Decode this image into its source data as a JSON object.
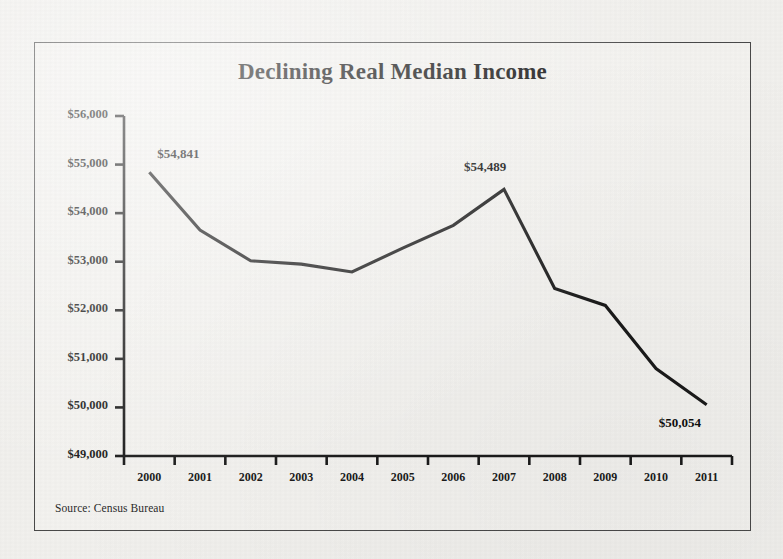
{
  "figure": {
    "source_note": "Source: Census Bureau",
    "border_color": "#4a4a4a",
    "background_color": "#f2f1ee",
    "line_color": "#1a1a1a"
  },
  "chart_data": {
    "type": "line",
    "title": "Declining Real Median Income",
    "xlabel": "",
    "ylabel": "",
    "categories": [
      "2000",
      "2001",
      "2002",
      "2003",
      "2004",
      "2005",
      "2006",
      "2007",
      "2008",
      "2009",
      "2010",
      "2011"
    ],
    "values": [
      54841,
      53650,
      53020,
      52950,
      52790,
      53280,
      53750,
      54489,
      52450,
      52100,
      50800,
      50054
    ],
    "series": [
      {
        "name": "Real Median Household Income",
        "values": [
          54841,
          53650,
          53020,
          52950,
          52790,
          53280,
          53750,
          54489,
          52450,
          52100,
          50800,
          50054
        ]
      }
    ],
    "ylim": [
      49000,
      56000
    ],
    "ytick_values": [
      56000,
      55000,
      54000,
      53000,
      52000,
      51000,
      50000,
      49000
    ],
    "ytick_labels": [
      "$56,000",
      "$55,000",
      "$54,000",
      "$53,000",
      "$52,000",
      "$51,000",
      "$50,000",
      "$49,000"
    ],
    "xtick_labels": [
      "2000",
      "2001",
      "2002",
      "2003",
      "2004",
      "2005",
      "2006",
      "2007",
      "2008",
      "2009",
      "2010",
      "2011"
    ],
    "grid": false,
    "legend": "none",
    "annotations": [
      {
        "text": "$54,841",
        "category": "2000",
        "value": 54841
      },
      {
        "text": "$54,489",
        "category": "2007",
        "value": 54489
      },
      {
        "text": "$50,054",
        "category": "2011",
        "value": 50054
      }
    ]
  }
}
